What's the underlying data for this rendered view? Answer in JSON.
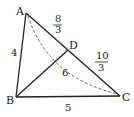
{
  "diagram": {
    "type": "triangle-geometry",
    "points": {
      "A": {
        "label": "A",
        "x": 26,
        "y": 13
      },
      "B": {
        "label": "B",
        "x": 16,
        "y": 97
      },
      "C": {
        "label": "C",
        "x": 120,
        "y": 96
      },
      "D": {
        "label": "D",
        "x": 68,
        "y": 50
      }
    },
    "segments": {
      "AB": {
        "label": "4"
      },
      "BC": {
        "label": "5"
      },
      "BD": {
        "label": "6"
      },
      "AD": {
        "numerator": "8",
        "denominator": "3"
      },
      "DC": {
        "numerator": "10",
        "denominator": "3"
      }
    },
    "dashed_curve": {
      "from": "A",
      "to": "C"
    },
    "stroke_color": "#222222"
  }
}
